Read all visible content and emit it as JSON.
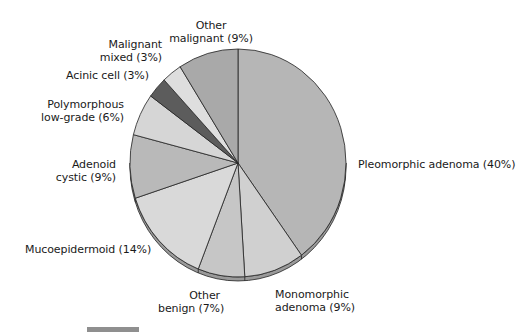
{
  "chart_data": {
    "type": "pie",
    "title": "",
    "start_angle_deg": 0,
    "direction": "clockwise",
    "slices": [
      {
        "label": "Pleomorphic adenoma",
        "value": 40,
        "display": "Pleomorphic adenoma (40%)",
        "color": "#b6b6b6"
      },
      {
        "label": "Monomorphic adenoma",
        "value": 9,
        "display": "Monomorphic adenoma (9%)",
        "color": "#d0d0d0"
      },
      {
        "label": "Other benign",
        "value": 7,
        "display": "Other benign (7%)",
        "color": "#c6c6c6"
      },
      {
        "label": "Mucoepidermoid",
        "value": 14,
        "display": "Mucoepidermoid (14%)",
        "color": "#d9d9d9"
      },
      {
        "label": "Adenoid cystic",
        "value": 9,
        "display": "Adenoid cystic (9%)",
        "color": "#b9b9b9"
      },
      {
        "label": "Polymorphous low-grade",
        "value": 6,
        "display": "Polymorphous low-grade (6%)",
        "color": "#d6d6d6"
      },
      {
        "label": "Acinic cell",
        "value": 3,
        "display": "Acinic cell (3%)",
        "color": "#5c5c5c"
      },
      {
        "label": "Malignant mixed",
        "value": 3,
        "display": "Malignant mixed (3%)",
        "color": "#dedede"
      },
      {
        "label": "Other malignant",
        "value": 9,
        "display": "Other malignant (9%)",
        "color": "#a9a9a9"
      }
    ],
    "legend": "none (direct labels)"
  },
  "labels": {
    "pleomorphic": "Pleomorphic adenoma (40%)",
    "monomorphic_1": "Monomorphic",
    "monomorphic_2": "adenoma (9%)",
    "other_benign_1": "Other",
    "other_benign_2": "benign (7%)",
    "mucoepidermoid": "Mucoepidermoid (14%)",
    "adenoid_1": "Adenoid",
    "adenoid_2": "cystic (9%)",
    "polymorphous_1": "Polymorphous",
    "polymorphous_2": "low-grade (6%)",
    "acinic": "Acinic cell (3%)",
    "malignant_mixed_1": "Malignant",
    "malignant_mixed_2": "mixed (3%)",
    "other_malignant_1": "Other",
    "other_malignant_2": "malignant (9%)"
  },
  "geometry": {
    "cx": 238,
    "cy": 163,
    "rx": 108,
    "ry": 114,
    "depth": 4,
    "edge_color": "#9a9a9a",
    "line_color": "#222222"
  }
}
